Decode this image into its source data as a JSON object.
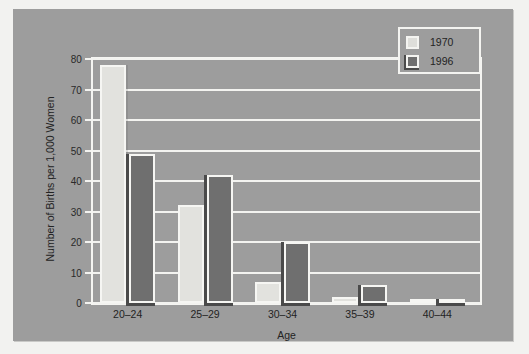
{
  "chart_data": {
    "type": "bar",
    "title": "",
    "xlabel": "Age",
    "ylabel": "Number of Births per 1,000 Women",
    "categories": [
      "20–24",
      "25–29",
      "30–34",
      "35–39",
      "40–44"
    ],
    "series": [
      {
        "name": "1970",
        "values": [
          78,
          32,
          7,
          2,
          1
        ],
        "color": "#e2e2de"
      },
      {
        "name": "1996",
        "values": [
          49,
          42,
          20,
          6,
          1
        ],
        "color": "#6f6f6f"
      }
    ],
    "ylim": [
      0,
      80
    ],
    "yticks": [
      0,
      10,
      20,
      30,
      40,
      50,
      60,
      70,
      80
    ],
    "ytick_labels": [
      "0",
      "10",
      "20",
      "30",
      "40",
      "50",
      "60",
      "70",
      "80"
    ],
    "grid": true,
    "grid_axis": "y",
    "legend_position": "top-right",
    "background_color": "#9d9d9d",
    "gridline_color": "#f3f3f0",
    "text_color": "#232323"
  }
}
